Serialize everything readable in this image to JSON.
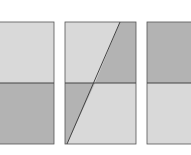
{
  "diagram": {
    "colors": {
      "light": "#d9d9d9",
      "dark": "#b3b3b3",
      "stroke": "#555555",
      "background": "#ffffff"
    },
    "panels": [
      {
        "name": "left-panel",
        "split": "horizontal",
        "top_shade": "light",
        "bottom_shade": "dark"
      },
      {
        "name": "middle-panel",
        "split": "horizontal-and-diagonal",
        "top_left_shade": "light",
        "top_right_shade": "dark",
        "bottom_left_shade": "dark",
        "bottom_right_shade": "light"
      },
      {
        "name": "right-panel",
        "split": "horizontal",
        "top_shade": "dark",
        "bottom_shade": "light"
      }
    ]
  }
}
